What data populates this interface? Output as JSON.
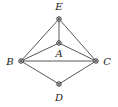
{
  "diagram": {
    "type": "graph",
    "nodes": [
      {
        "id": "E",
        "label": "E",
        "x": 59,
        "y": 19,
        "lx": 59,
        "ly": 7
      },
      {
        "id": "A",
        "label": "A",
        "x": 59,
        "y": 43,
        "lx": 59,
        "ly": 54
      },
      {
        "id": "B",
        "label": "B",
        "x": 21,
        "y": 61,
        "lx": 10,
        "ly": 62
      },
      {
        "id": "C",
        "label": "C",
        "x": 96,
        "y": 61,
        "lx": 107,
        "ly": 62
      },
      {
        "id": "D",
        "label": "D",
        "x": 59,
        "y": 84,
        "lx": 59,
        "ly": 98
      }
    ],
    "edges": [
      [
        "E",
        "A"
      ],
      [
        "E",
        "B"
      ],
      [
        "E",
        "C"
      ],
      [
        "A",
        "B"
      ],
      [
        "A",
        "C"
      ],
      [
        "B",
        "C"
      ],
      [
        "B",
        "D"
      ],
      [
        "C",
        "D"
      ]
    ],
    "colors": {
      "line": "#444444",
      "node_stroke": "#222222",
      "background": "#ffffff"
    }
  }
}
